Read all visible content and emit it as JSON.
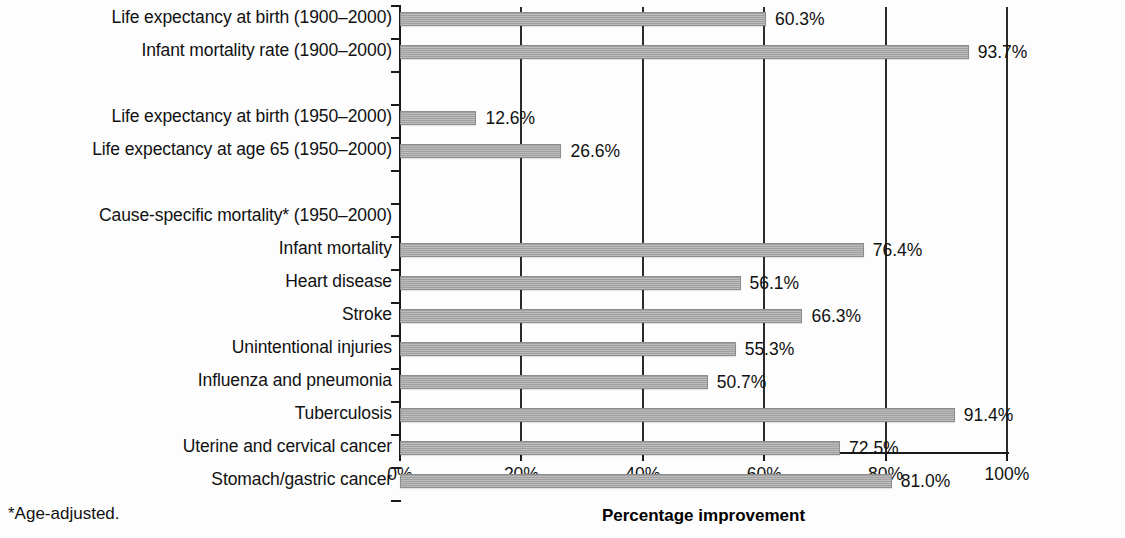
{
  "chart_data": {
    "type": "bar",
    "orientation": "horizontal",
    "title": "",
    "xlabel": "Percentage improvement",
    "ylabel": "",
    "xlim": [
      0,
      100
    ],
    "xticks": [
      "0%",
      "20%",
      "40%",
      "60%",
      "80%",
      "100%"
    ],
    "xtick_values": [
      0,
      20,
      40,
      60,
      80,
      100
    ],
    "grid": "vertical",
    "legend": "none",
    "footnote": "*Age-adjusted.",
    "bar_color": "#a9a9a9",
    "categories": [
      "Life expectancy at birth (1900–2000)",
      "Infant mortality rate (1900–2000)",
      "",
      "Life expectancy at birth (1950–2000)",
      "Life expectancy at age 65 (1950–2000)",
      "",
      "Cause-specific mortality* (1950–2000)",
      "Infant mortality",
      "Heart disease",
      "Stroke",
      "Unintentional injuries",
      "Influenza and pneumonia",
      "Tuberculosis",
      "Uterine and cervical cancer",
      "Stomach/gastric cancer"
    ],
    "values": [
      60.3,
      93.7,
      null,
      12.6,
      26.6,
      null,
      null,
      76.4,
      56.1,
      66.3,
      55.3,
      50.7,
      91.4,
      72.5,
      81.0
    ],
    "value_labels": [
      "60.3%",
      "93.7%",
      "",
      "12.6%",
      "26.6%",
      "",
      "",
      "76.4%",
      "56.1%",
      "66.3%",
      "55.3%",
      "50.7%",
      "91.4%",
      "72.5%",
      "81.0%"
    ]
  },
  "rows": [
    {
      "label": "Life expectancy at birth (1900–2000)",
      "value": 60.3,
      "value_label": "60.3%",
      "has_bar": true,
      "row": 0
    },
    {
      "label": "Infant mortality rate (1900–2000)",
      "value": 93.7,
      "value_label": "93.7%",
      "has_bar": true,
      "row": 1
    },
    {
      "label": "Life expectancy at birth (1950–2000)",
      "value": 12.6,
      "value_label": "12.6%",
      "has_bar": true,
      "row": 3
    },
    {
      "label": "Life expectancy at age 65 (1950–2000)",
      "value": 26.6,
      "value_label": "26.6%",
      "has_bar": true,
      "row": 4
    },
    {
      "label": "Cause-specific mortality* (1950–2000)",
      "value": null,
      "value_label": "",
      "has_bar": false,
      "row": 6
    },
    {
      "label": "Infant mortality",
      "value": 76.4,
      "value_label": "76.4%",
      "has_bar": true,
      "row": 7
    },
    {
      "label": "Heart disease",
      "value": 56.1,
      "value_label": "56.1%",
      "has_bar": true,
      "row": 8
    },
    {
      "label": "Stroke",
      "value": 66.3,
      "value_label": "66.3%",
      "has_bar": true,
      "row": 9
    },
    {
      "label": "Unintentional injuries",
      "value": 55.3,
      "value_label": "55.3%",
      "has_bar": true,
      "row": 10
    },
    {
      "label": "Influenza and pneumonia",
      "value": 50.7,
      "value_label": "50.7%",
      "has_bar": true,
      "row": 11
    },
    {
      "label": "Tuberculosis",
      "value": 91.4,
      "value_label": "91.4%",
      "has_bar": true,
      "row": 12
    },
    {
      "label": "Uterine and cervical cancer",
      "value": 72.5,
      "value_label": "72.5%",
      "has_bar": true,
      "row": 13
    },
    {
      "label": "Stomach/gastric cancer",
      "value": 81.0,
      "value_label": "81.0%",
      "has_bar": true,
      "row": 14
    }
  ],
  "axis": {
    "title": "Percentage improvement",
    "ticks": [
      {
        "label": "0%",
        "value": 0
      },
      {
        "label": "20%",
        "value": 20
      },
      {
        "label": "40%",
        "value": 40
      },
      {
        "label": "60%",
        "value": 60
      },
      {
        "label": "80%",
        "value": 80
      },
      {
        "label": "100%",
        "value": 100
      }
    ]
  },
  "footnote": {
    "text": "*Age-adjusted."
  }
}
